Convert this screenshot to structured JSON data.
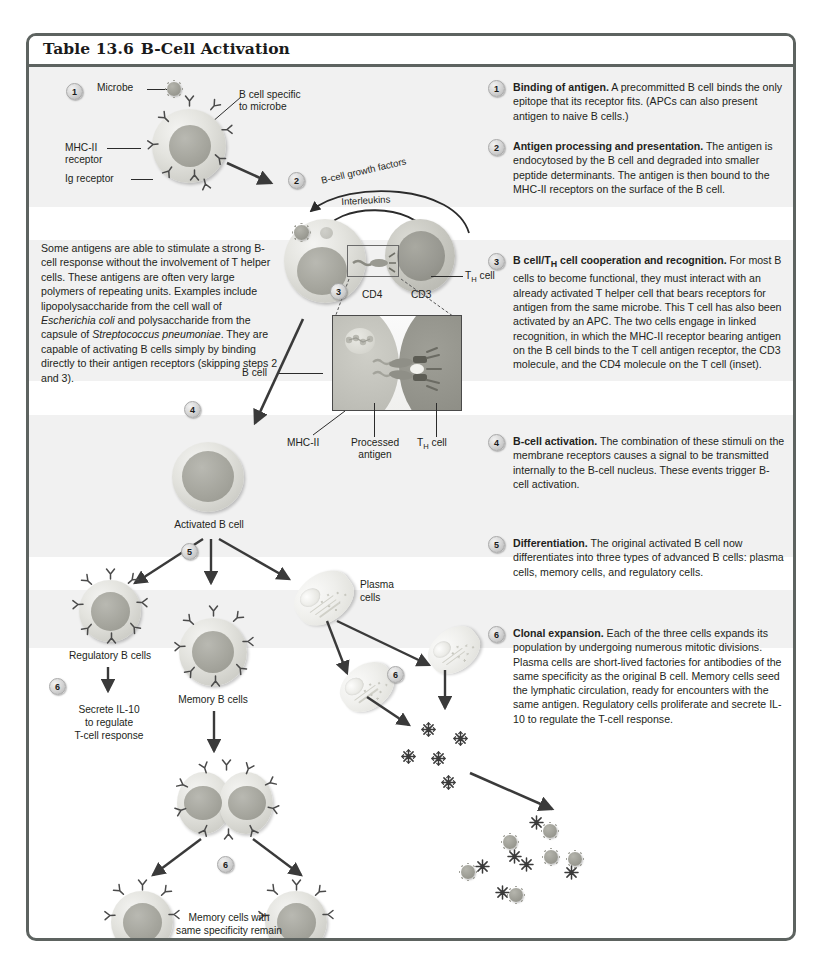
{
  "figure": {
    "table_number": "Table 13.6",
    "title": "B-Cell Activation"
  },
  "steps": [
    {
      "number": "1",
      "title": "Binding of antigen.",
      "body": " A precommitted B cell binds the only epitope that its receptor fits. (APCs can also present antigen to naive B cells.)"
    },
    {
      "number": "2",
      "title": "Antigen processing and presentation.",
      "body": " The antigen is endocytosed by the B cell and degraded into smaller peptide determinants. The antigen is then bound to the MHC-II receptors on the surface of the B cell."
    },
    {
      "number": "3",
      "title_html": "B cell/T<sub>H</sub> cell cooperation and recognition.",
      "body": " For most B cells to become functional, they must interact with an already activated T helper cell that bears receptors for antigen from the same microbe. This T cell has also been activated by an APC. The two cells engage in linked recognition, in which the MHC-II receptor bearing antigen on the B cell binds to the T cell antigen receptor, the CD3 molecule, and the CD4 molecule on the T cell (inset)."
    },
    {
      "number": "4",
      "title": "B-cell activation.",
      "body": " The combination of these stimuli on the membrane receptors causes a signal to be transmitted internally to the B-cell nucleus. These events trigger B-cell activation."
    },
    {
      "number": "5",
      "title": "Differentiation.",
      "body": " The original activated B cell now differentiates into three types of advanced B cells: plasma cells, memory cells, and regulatory cells."
    },
    {
      "number": "6",
      "title": "Clonal expansion.",
      "body": " Each of the three cells expands its population by undergoing numerous mitotic divisions. Plasma cells are short-lived factories for antibodies of the same specificity as the original B cell. Memory cells seed the lymphatic circulation, ready for encounters with the same antigen. Regulatory cells proliferate and secrete IL-10 to regulate the T-cell response."
    }
  ],
  "sidenote": {
    "line1": "Some antigens are able to stimulate a strong B-cell response without the involvement of T helper cells. These antigens are often very large polymers of repeating units. Examples include lipopolysaccharide from the cell wall of ",
    "italic1": "Escherichia coli",
    "line2": " and polysaccharide from the capsule of ",
    "italic2": "Streptococcus pneumoniae",
    "line3": ". They are capable of activating B cells simply by binding directly to their antigen receptors (skipping steps 2 and 3)."
  },
  "diagram_labels": {
    "microbe": "Microbe",
    "b_cell_specific_l1": "B cell specific",
    "b_cell_specific_l2": "to microbe",
    "mhc_ii_receptor_l1": "MHC-II",
    "mhc_ii_receptor_l2": "receptor",
    "ig_receptor": "Ig receptor",
    "growth_factors": "B-cell growth factors",
    "interleukins": "Interleukins",
    "th_cell": "T",
    "th_cell_sub": "H",
    "th_cell_tail": " cell",
    "cd4": "CD4",
    "cd3": "CD3",
    "b_cell": "B cell",
    "mhc_ii": "MHC-II",
    "processed_antigen_l1": "Processed",
    "processed_antigen_l2": "antigen",
    "activated_b_cell": "Activated B cell",
    "regulatory_b_cells": "Regulatory B cells",
    "memory_b_cells": "Memory B cells",
    "plasma_cells_l1": "Plasma",
    "plasma_cells_l2": "cells",
    "secrete_l1": "Secrete IL-10",
    "secrete_l2": "to regulate",
    "secrete_l3": "T-cell response",
    "memory_remain_l1": "Memory cells with",
    "memory_remain_l2": "same specificity remain",
    "memory_remain_l3": "in lymphatic circulation"
  },
  "inline_step_badges": {
    "b1": "1",
    "b2": "2",
    "b3": "3",
    "b4": "4",
    "b5": "5",
    "b6a": "6",
    "b6b": "6",
    "b6c": "6"
  },
  "colors": {
    "frame": "#5d6360",
    "band": "#f1f1f1",
    "text": "#231f20",
    "cell_fill": "#e3e3de",
    "nucleus": "#a6a69e",
    "arrow": "#3a3a3a"
  }
}
